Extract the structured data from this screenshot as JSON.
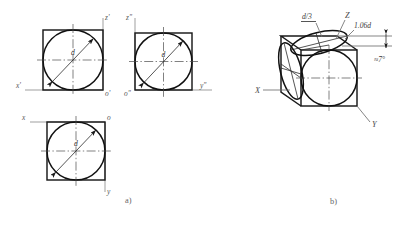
{
  "figure": {
    "title_parts": {
      "caption_a": "a)",
      "caption_b": "b)"
    },
    "colors": {
      "outline": "#1a1a1a",
      "circle": "#111111",
      "axis": "#8e8e8e",
      "centerline": "#4a4a4a",
      "label": "#555555",
      "background": "#ffffff"
    }
  },
  "part_a": {
    "caption": "a)",
    "views": [
      {
        "name": "frontal-projection",
        "axis_labels": {
          "vertical": "z'",
          "horizontal": "x'",
          "origin": "o'"
        },
        "dimension_label": "d"
      },
      {
        "name": "profile-projection",
        "axis_labels": {
          "vertical": "z\"",
          "horizontal": "y\"",
          "origin": "o\""
        },
        "dimension_label": "d"
      },
      {
        "name": "horizontal-projection",
        "axis_labels": {
          "vertical": "y",
          "horizontal": "x",
          "origin": "o"
        },
        "dimension_label": "d"
      }
    ]
  },
  "part_b": {
    "caption": "b)",
    "axis_labels": {
      "x": "X",
      "y": "Y",
      "z": "Z"
    },
    "annotations": {
      "fraction": "d/3",
      "fraction_numerator": "d",
      "fraction_denominator": "3",
      "major_axis": "1.06d",
      "angle": "≈7°"
    }
  }
}
